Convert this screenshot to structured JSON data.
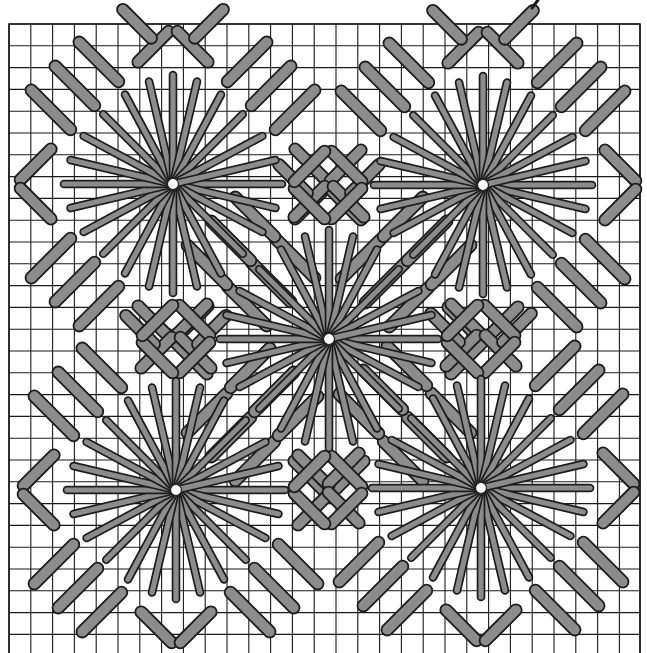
{
  "figure": {
    "title": "Needlepoint star stitch chart",
    "colors": {
      "background": "#ffffff",
      "grid": "#1a1a1a",
      "stitch_fill": "#8c8c8c",
      "stitch_outline": "#1c1c1c",
      "center_hole": "#ffffff"
    }
  },
  "grid": {
    "origin_x": 9,
    "origin_y": 24,
    "cell": 21.8,
    "cols": 29,
    "rows": 29,
    "right_edge": 640,
    "bottom_edge": 653,
    "stitch_width": 11
  },
  "stars": [
    {
      "name": "star-top-left",
      "cx": 173,
      "cy": 184
    },
    {
      "name": "star-top-right",
      "cx": 483,
      "cy": 185
    },
    {
      "name": "star-center",
      "cx": 329,
      "cy": 339
    },
    {
      "name": "star-bottom-left",
      "cx": 176,
      "cy": 490
    },
    {
      "name": "star-bottom-right",
      "cx": 481,
      "cy": 488
    }
  ],
  "star_ray_offsets_cells": [
    [
      5,
      0
    ],
    [
      4.7,
      1.1
    ],
    [
      4.1,
      2.2
    ],
    [
      3.2,
      3.2
    ],
    [
      2.2,
      4.1
    ],
    [
      1.1,
      4.7
    ],
    [
      0,
      5
    ],
    [
      -1.1,
      4.7
    ],
    [
      -2.2,
      4.1
    ],
    [
      -3.2,
      3.2
    ],
    [
      -4.1,
      2.2
    ],
    [
      -4.7,
      1.1
    ],
    [
      -5,
      0
    ],
    [
      -4.7,
      -1.1
    ],
    [
      -4.1,
      -2.2
    ],
    [
      -3.2,
      -3.2
    ],
    [
      -2.2,
      -4.1
    ],
    [
      -1.1,
      -4.7
    ],
    [
      0,
      -5
    ],
    [
      1.1,
      -4.7
    ],
    [
      2.2,
      -4.1
    ],
    [
      3.2,
      -3.2
    ],
    [
      4.1,
      -2.2
    ],
    [
      4.7,
      -1.1
    ]
  ],
  "motif_bars_cells": [
    [
      -1.6,
      -5.6,
      -0.2,
      -7.0
    ],
    [
      1.6,
      -5.6,
      0.2,
      -7.0
    ],
    [
      -2.5,
      -4.7,
      -4.3,
      -6.5
    ],
    [
      2.5,
      -4.7,
      4.3,
      -6.5
    ],
    [
      -3.6,
      -3.6,
      -5.4,
      -5.4
    ],
    [
      3.6,
      -3.6,
      5.4,
      -5.4
    ],
    [
      -4.7,
      -2.5,
      -6.5,
      -4.3
    ],
    [
      4.7,
      -2.5,
      6.5,
      -4.3
    ],
    [
      -5.6,
      -1.6,
      -7.0,
      -0.2
    ],
    [
      5.6,
      -1.6,
      7.0,
      -0.2
    ],
    [
      -1.6,
      5.6,
      -0.2,
      7.0
    ],
    [
      1.6,
      5.6,
      0.2,
      7.0
    ],
    [
      -2.5,
      4.7,
      -4.3,
      6.5
    ],
    [
      2.5,
      4.7,
      4.3,
      6.5
    ],
    [
      -3.6,
      3.6,
      -5.4,
      5.4
    ],
    [
      3.6,
      3.6,
      5.4,
      5.4
    ],
    [
      -4.7,
      2.5,
      -6.5,
      4.3
    ],
    [
      4.7,
      2.5,
      6.5,
      4.3
    ],
    [
      -5.6,
      1.6,
      -7.0,
      0.2
    ],
    [
      5.6,
      1.6,
      7.0,
      0.2
    ],
    [
      -1.0,
      -6.7,
      -2.3,
      -8.0
    ],
    [
      1.0,
      -6.7,
      2.3,
      -8.0
    ]
  ],
  "small_diamonds": [
    {
      "name": "diamond-top-middle",
      "cx": 328,
      "cy": 185
    },
    {
      "name": "diamond-left-middle",
      "cx": 176,
      "cy": 339
    },
    {
      "name": "diamond-right-middle",
      "cx": 481,
      "cy": 339
    },
    {
      "name": "diamond-bottom-middle",
      "cx": 328,
      "cy": 490
    }
  ],
  "small_diamond_half_cells": 1.7,
  "corner_mark": {
    "x1": 532,
    "y1": 8,
    "x2": 538,
    "y2": 0
  }
}
